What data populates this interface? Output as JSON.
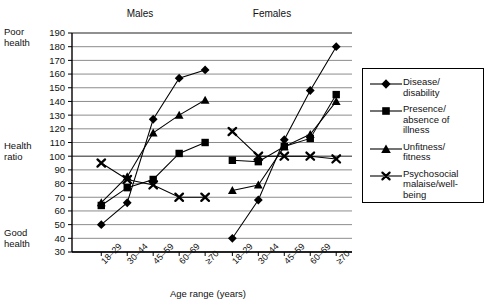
{
  "chart_data": {
    "type": "line",
    "title": "",
    "xlabel": "Age range (years)",
    "ylabel": "Health ratio",
    "ylim": [
      30,
      190
    ],
    "ytick_step": 10,
    "yticks": [
      30,
      40,
      50,
      60,
      70,
      80,
      90,
      100,
      110,
      120,
      130,
      140,
      150,
      160,
      170,
      180,
      190
    ],
    "grid": true,
    "legend_position": "right",
    "axis_annotations": {
      "top_left_line1": "Poor",
      "top_left_line2": "health",
      "mid_left_line1": "Health",
      "mid_left_line2": "ratio",
      "bottom_left_line1": "Good",
      "bottom_left_line2": "health"
    },
    "panels": [
      {
        "name": "Males",
        "label": "Males",
        "categories": [
          "18–29",
          "30–44",
          "45–59",
          "60–69",
          "≥70"
        ]
      },
      {
        "name": "Females",
        "label": "Females",
        "categories": [
          "18–29",
          "30–44",
          "45–59",
          "60–69",
          "≥70"
        ]
      }
    ],
    "categories": [
      "18–29",
      "30–44",
      "45–59",
      "60–69",
      "≥70"
    ],
    "series": [
      {
        "name": "Disease/ disability",
        "marker": "diamond",
        "males": [
          50,
          66,
          127,
          157,
          163
        ],
        "females": [
          40,
          68,
          112,
          148,
          180
        ]
      },
      {
        "name": "Presence/ absence of illness",
        "marker": "square",
        "males": [
          64,
          77,
          83,
          102,
          110
        ],
        "females": [
          97,
          96,
          107,
          113,
          145
        ]
      },
      {
        "name": "Unfitness/ fitness",
        "marker": "triangle",
        "males": [
          66,
          85,
          117,
          130,
          141
        ],
        "females": [
          75,
          79,
          107,
          116,
          140
        ]
      },
      {
        "name": "Psychosocial malaise/well-being",
        "marker": "cross",
        "males": [
          95,
          83,
          79,
          70,
          70
        ],
        "females": [
          118,
          100,
          100,
          100,
          98
        ]
      }
    ]
  },
  "legend": {
    "entries": [
      {
        "lines": [
          "Disease/",
          "disability"
        ],
        "marker": "diamond"
      },
      {
        "lines": [
          "Presence/",
          "absence of",
          "illness"
        ],
        "marker": "square"
      },
      {
        "lines": [
          "Unfitness/",
          "fitness"
        ],
        "marker": "triangle"
      },
      {
        "lines": [
          "Psychosocial",
          "malaise/well-",
          "being"
        ],
        "marker": "cross"
      }
    ],
    "e0l0": "Disease/",
    "e0l1": "disability",
    "e1l0": "Presence/",
    "e1l1": "absence of",
    "e1l2": "illness",
    "e2l0": "Unfitness/",
    "e2l1": "fitness",
    "e3l0": "Psychosocial",
    "e3l1": "malaise/well-",
    "e3l2": "being"
  },
  "axis_labels": {
    "poor_1": "Poor",
    "poor_2": "health",
    "health_1": "Health",
    "health_2": "ratio",
    "good_1": "Good",
    "good_2": "health",
    "x_title": "Age range (years)"
  },
  "panel_titles": {
    "males": "Males",
    "females": "Females"
  },
  "colors": {
    "line": "#000000",
    "grid": "#808080",
    "axis": "#000000",
    "background": "#ffffff"
  }
}
